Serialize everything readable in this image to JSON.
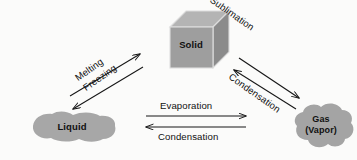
{
  "diagram": {
    "background_color": "#fbfbfa",
    "ink_color": "#111111",
    "nodes": [
      {
        "id": "solid",
        "label": "Solid",
        "shape": "cube",
        "fill_front": "#9d9d9d",
        "fill_top": "#b6b6b6",
        "fill_side": "#8a8a8a",
        "stroke": "#d9d9d9"
      },
      {
        "id": "liquid",
        "label": "Liquid",
        "shape": "blob",
        "fill": "#a6a6a6"
      },
      {
        "id": "gas",
        "label": "Gas",
        "sublabel": "(Vapor)",
        "shape": "cloud",
        "fill": "#a3a3a3"
      }
    ],
    "edges": [
      {
        "id": "melting",
        "label": "Melting",
        "from": "liquid",
        "to": "solid",
        "orientation": "diagonal-up-right"
      },
      {
        "id": "freezing",
        "label": "Freezing",
        "from": "solid",
        "to": "liquid",
        "orientation": "diagonal-down-left"
      },
      {
        "id": "sublimation",
        "label": "Sublimation",
        "from": "solid",
        "to": "gas",
        "orientation": "diagonal-down-right"
      },
      {
        "id": "deposition",
        "label": "Condensation",
        "from": "gas",
        "to": "solid",
        "orientation": "diagonal-up-left"
      },
      {
        "id": "evaporation",
        "label": "Evaporation",
        "from": "liquid",
        "to": "gas",
        "orientation": "horizontal-right"
      },
      {
        "id": "condensation",
        "label": "Condensation",
        "from": "gas",
        "to": "liquid",
        "orientation": "horizontal-left"
      }
    ]
  }
}
